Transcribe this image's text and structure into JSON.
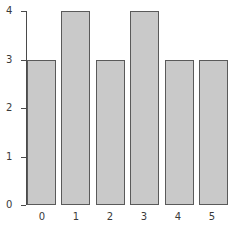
{
  "chart_data": {
    "type": "bar",
    "title": "",
    "subtitle": "",
    "xlabel": "",
    "ylabel": "",
    "categories": [
      "0",
      "1",
      "2",
      "3",
      "4",
      "5"
    ],
    "values": [
      3,
      4,
      3,
      4,
      3,
      3
    ],
    "series": [
      {
        "name": "counts",
        "values": [
          3,
          4,
          3,
          4,
          3,
          3
        ]
      }
    ],
    "xlim": [
      -0.5,
      5.5
    ],
    "ylim": [
      0,
      4
    ],
    "yticks": [
      "0",
      "1",
      "2",
      "3",
      "4"
    ],
    "ytick_values": [
      0,
      1,
      2,
      3,
      4
    ],
    "xticks": [
      "0",
      "1",
      "2",
      "3",
      "4",
      "5"
    ],
    "grid": false,
    "legend": null,
    "legend_position": "none",
    "annotations": [],
    "colors": {
      "bar_fill": "#c9c9c9",
      "bar_edge": "#5a5a5a",
      "axis": "#4a4a4a",
      "tick_label": "#3a3a3a",
      "background": "#ffffff"
    }
  }
}
